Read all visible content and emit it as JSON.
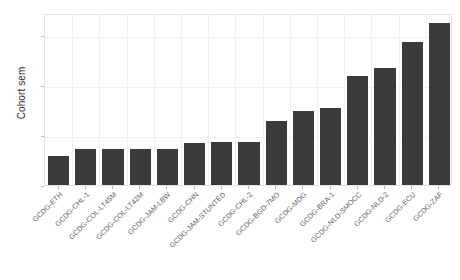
{
  "chart_data": {
    "type": "bar",
    "title": "",
    "xlabel": "",
    "ylabel": "Cohort sem",
    "ylim": [
      0,
      3.45
    ],
    "yticks": [
      0,
      1,
      2,
      3
    ],
    "ytick_labels": [
      "0",
      "1",
      "2",
      "3"
    ],
    "grid": "faint-panel-grid",
    "legend": "none",
    "bar_color": "#3b3b3b",
    "panel_background": "#ffffff",
    "panel_border_color": "#e2e2e6",
    "gridline_color": "#f1f1f4",
    "categories": [
      "GCDG-ETH",
      "GCDG-CHL-1",
      "GCDG-COL-LT45M",
      "GCDG-COL-LT42M",
      "GCDG-JAM-LBW",
      "GCDG-CHN",
      "GCDG-JAM-STUNTED",
      "GCDG-CHL-2",
      "GCDG-BGD-7MO",
      "GCDG-MDG",
      "GCDG-BRA-1",
      "GCDG-NLD-SMOCC",
      "GCDG-NLD-2",
      "GCDG-ECU",
      "GCDG-ZAF"
    ],
    "values": [
      0.58,
      0.72,
      0.72,
      0.72,
      0.72,
      0.85,
      0.86,
      0.87,
      1.28,
      1.49,
      1.55,
      2.18,
      2.34,
      2.86,
      3.25
    ]
  }
}
